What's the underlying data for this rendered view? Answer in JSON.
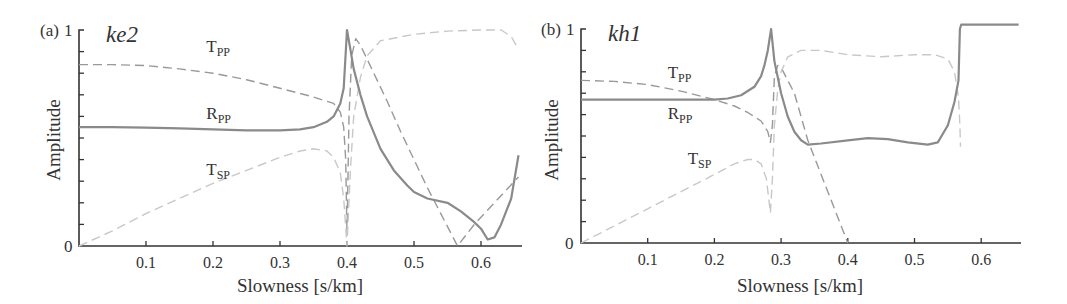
{
  "chart_data": [
    {
      "type": "line",
      "panel": "(a)",
      "title": "ke2",
      "xlabel": "Slowness [s/km]",
      "ylabel": "Amplitude",
      "xlim": [
        0,
        0.66
      ],
      "ylim": [
        0,
        1
      ],
      "xticks": [
        "0.1",
        "0.2",
        "0.3",
        "0.4",
        "0.5",
        "0.6"
      ],
      "yticks": [
        "0",
        "1"
      ],
      "grid": false,
      "series": [
        {
          "name": "R_PP",
          "label_main": "R",
          "label_sub": "PP",
          "style": "solid",
          "color": "#8a8a8a",
          "x": [
            0,
            0.05,
            0.1,
            0.15,
            0.2,
            0.25,
            0.3,
            0.33,
            0.35,
            0.37,
            0.38,
            0.39,
            0.395,
            0.4,
            0.405,
            0.41,
            0.42,
            0.43,
            0.45,
            0.47,
            0.49,
            0.5,
            0.52,
            0.55,
            0.57,
            0.59,
            0.6,
            0.61,
            0.62,
            0.63,
            0.645,
            0.656
          ],
          "y": [
            0.55,
            0.55,
            0.548,
            0.545,
            0.54,
            0.535,
            0.535,
            0.54,
            0.55,
            0.575,
            0.6,
            0.66,
            0.73,
            1.0,
            0.91,
            0.82,
            0.7,
            0.6,
            0.45,
            0.35,
            0.28,
            0.25,
            0.22,
            0.2,
            0.16,
            0.11,
            0.08,
            0.03,
            0.04,
            0.1,
            0.22,
            0.42
          ]
        },
        {
          "name": "T_PP",
          "label_main": "T",
          "label_sub": "PP",
          "style": "dashed",
          "color": "#999999",
          "x": [
            0,
            0.05,
            0.1,
            0.15,
            0.2,
            0.25,
            0.3,
            0.35,
            0.38,
            0.39,
            0.395,
            0.398,
            0.4,
            0.403,
            0.407,
            0.413,
            0.42,
            0.44,
            0.46,
            0.48,
            0.5,
            0.52,
            0.54,
            0.565,
            0.59,
            0.62,
            0.656
          ],
          "y": [
            0.84,
            0.84,
            0.835,
            0.82,
            0.8,
            0.77,
            0.73,
            0.69,
            0.66,
            0.62,
            0.55,
            0.4,
            0.05,
            0.6,
            0.88,
            0.96,
            0.93,
            0.8,
            0.67,
            0.53,
            0.4,
            0.27,
            0.15,
            0.0,
            0.1,
            0.2,
            0.32
          ]
        },
        {
          "name": "T_SP",
          "label_main": "T",
          "label_sub": "SP",
          "style": "dashed",
          "color": "#c8c8c8",
          "x": [
            0,
            0.05,
            0.1,
            0.15,
            0.2,
            0.25,
            0.3,
            0.33,
            0.35,
            0.37,
            0.38,
            0.39,
            0.395,
            0.4,
            0.405,
            0.41,
            0.42,
            0.43,
            0.45,
            0.5,
            0.55,
            0.6,
            0.63,
            0.645,
            0.656
          ],
          "y": [
            0.0,
            0.07,
            0.15,
            0.22,
            0.29,
            0.35,
            0.41,
            0.44,
            0.45,
            0.44,
            0.41,
            0.34,
            0.22,
            0.0,
            0.35,
            0.6,
            0.78,
            0.88,
            0.95,
            0.98,
            0.995,
            1.0,
            1.0,
            0.97,
            0.91
          ]
        }
      ],
      "annotations": [
        {
          "text": "T_PP",
          "x": 0.19,
          "y": 0.9
        },
        {
          "text": "R_PP",
          "x": 0.19,
          "y": 0.59
        },
        {
          "text": "T_SP",
          "x": 0.19,
          "y": 0.33
        }
      ]
    },
    {
      "type": "line",
      "panel": "(b)",
      "title": "kh1",
      "xlabel": "Slowness [s/km]",
      "ylabel": "Amplitude",
      "xlim": [
        0,
        0.66
      ],
      "ylim": [
        0,
        1
      ],
      "xticks": [
        "0.1",
        "0.2",
        "0.3",
        "0.4",
        "0.5",
        "0.6"
      ],
      "yticks": [
        "0",
        "1"
      ],
      "grid": false,
      "series": [
        {
          "name": "R_PP",
          "label_main": "R",
          "label_sub": "PP",
          "style": "solid",
          "color": "#8a8a8a",
          "x": [
            0,
            0.05,
            0.1,
            0.15,
            0.2,
            0.22,
            0.24,
            0.26,
            0.27,
            0.275,
            0.28,
            0.285,
            0.29,
            0.3,
            0.31,
            0.32,
            0.33,
            0.34,
            0.36,
            0.4,
            0.43,
            0.46,
            0.49,
            0.52,
            0.535,
            0.55,
            0.56,
            0.566,
            0.568,
            0.57,
            0.62,
            0.656
          ],
          "y": [
            0.67,
            0.67,
            0.67,
            0.67,
            0.67,
            0.675,
            0.69,
            0.73,
            0.78,
            0.83,
            0.9,
            1.0,
            0.85,
            0.7,
            0.59,
            0.52,
            0.48,
            0.46,
            0.465,
            0.48,
            0.49,
            0.485,
            0.47,
            0.46,
            0.47,
            0.55,
            0.66,
            0.76,
            1.0,
            1.02,
            1.02,
            1.02
          ]
        },
        {
          "name": "T_PP",
          "label_main": "T",
          "label_sub": "PP",
          "style": "dashed",
          "color": "#999999",
          "x": [
            0,
            0.05,
            0.1,
            0.15,
            0.2,
            0.23,
            0.25,
            0.27,
            0.28,
            0.284,
            0.287,
            0.29,
            0.295,
            0.3,
            0.32,
            0.34,
            0.36,
            0.38,
            0.4
          ],
          "y": [
            0.76,
            0.755,
            0.74,
            0.71,
            0.67,
            0.64,
            0.61,
            0.57,
            0.52,
            0.47,
            0.55,
            0.78,
            0.83,
            0.82,
            0.7,
            0.48,
            0.32,
            0.16,
            0.0
          ]
        },
        {
          "name": "T_SP",
          "label_main": "T",
          "label_sub": "SP",
          "style": "dashed",
          "color": "#c8c8c8",
          "x": [
            0,
            0.05,
            0.1,
            0.15,
            0.2,
            0.23,
            0.25,
            0.26,
            0.27,
            0.278,
            0.284,
            0.287,
            0.29,
            0.295,
            0.3,
            0.31,
            0.33,
            0.36,
            0.4,
            0.45,
            0.5,
            0.53,
            0.55,
            0.56,
            0.566,
            0.568,
            0.569
          ],
          "y": [
            0.0,
            0.08,
            0.16,
            0.24,
            0.32,
            0.37,
            0.39,
            0.39,
            0.37,
            0.3,
            0.14,
            0.3,
            0.55,
            0.72,
            0.8,
            0.87,
            0.9,
            0.9,
            0.88,
            0.87,
            0.88,
            0.88,
            0.86,
            0.8,
            0.68,
            0.55,
            0.45
          ]
        }
      ],
      "annotations": [
        {
          "text": "T_PP",
          "x": 0.13,
          "y": 0.77
        },
        {
          "text": "R_PP",
          "x": 0.13,
          "y": 0.58
        },
        {
          "text": "T_SP",
          "x": 0.16,
          "y": 0.37
        }
      ]
    }
  ],
  "panels": [
    {
      "id": "a",
      "panel_label": "(a)",
      "y_top_label": "1",
      "y_bottom_label": "0",
      "model": "ke2",
      "ylabel": "Amplitude",
      "xlabel": "Slowness [s/km]"
    },
    {
      "id": "b",
      "panel_label": "(b)",
      "y_top_label": "1",
      "y_bottom_label": "0",
      "model": "kh1",
      "ylabel": "Amplitude",
      "xlabel": "Slowness [s/km]"
    }
  ]
}
